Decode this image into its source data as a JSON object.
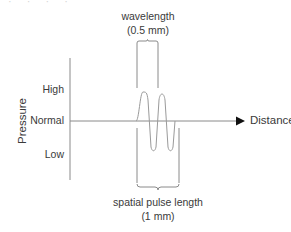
{
  "diagram": {
    "y_axis_title": "Pressure",
    "y_levels": [
      "High",
      "Normal",
      "Low"
    ],
    "x_axis_title": "Distance",
    "top_annotation": {
      "label": "wavelength",
      "value": "(0.5 mm)"
    },
    "bottom_annotation": {
      "label": "spatial pulse length",
      "value": "(1 mm)"
    },
    "faint_header": "· · · ·",
    "line_color": "#9a9a9a",
    "text_color": "#3a3a3a"
  }
}
